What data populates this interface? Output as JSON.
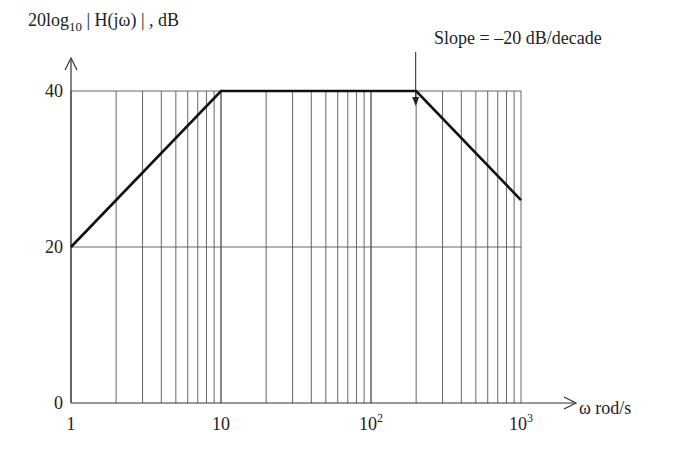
{
  "chart_data": {
    "type": "line",
    "title": "",
    "ylabel": "20log10 |H(jω)|, dB",
    "ylabel_parts": {
      "prefix": "20log",
      "sub": "10",
      "mid": " | H(jω) | , dB"
    },
    "xlabel": "ω rod/s",
    "x_scale": "log",
    "xlim": [
      1,
      1000
    ],
    "ylim": [
      0,
      40
    ],
    "x_ticks": [
      {
        "value": 1,
        "label": "1"
      },
      {
        "value": 10,
        "label": "10"
      },
      {
        "value": 100,
        "label": "10",
        "sup": "2"
      },
      {
        "value": 1000,
        "label": "10",
        "sup": "3"
      }
    ],
    "y_ticks": [
      {
        "value": 0,
        "label": "0"
      },
      {
        "value": 20,
        "label": "20"
      },
      {
        "value": 40,
        "label": "40"
      }
    ],
    "grid": true,
    "series": [
      {
        "name": "Bode magnitude (asymptotic)",
        "x": [
          1,
          10,
          200,
          1000
        ],
        "y": [
          20,
          40,
          40,
          26
        ]
      }
    ],
    "annotations": [
      {
        "text": "Slope = –20 dB/decade",
        "arrow_to": {
          "x": 250,
          "y": 40
        }
      }
    ],
    "legend": null
  }
}
